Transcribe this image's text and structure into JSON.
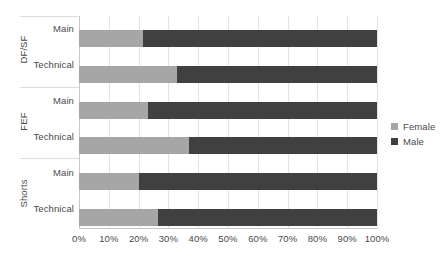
{
  "chart_data": {
    "type": "bar",
    "orientation": "horizontal",
    "stacked": true,
    "normalized": true,
    "title": "",
    "xlabel": "",
    "ylabel": "",
    "xlim": [
      0,
      100
    ],
    "grid": true,
    "legend_position": "right",
    "xticks": [
      "0%",
      "10%",
      "20%",
      "30%",
      "40%",
      "50%",
      "60%",
      "70%",
      "80%",
      "90%",
      "100%"
    ],
    "xtick_values": [
      0,
      10,
      20,
      30,
      40,
      50,
      60,
      70,
      80,
      90,
      100
    ],
    "groups": [
      {
        "label": "DF/SF",
        "categories": [
          {
            "label": "Main",
            "female": 21.5,
            "male": 78.5
          },
          {
            "label": "Technical",
            "female": 32.9,
            "male": 67.1
          }
        ]
      },
      {
        "label": "FEF",
        "categories": [
          {
            "label": "Main",
            "female": 23.2,
            "male": 76.8
          },
          {
            "label": "Technical",
            "female": 36.9,
            "male": 63.1
          }
        ]
      },
      {
        "label": "Shorts",
        "categories": [
          {
            "label": "Main",
            "female": 20.1,
            "male": 79.9
          },
          {
            "label": "Technical",
            "female": 26.5,
            "male": 73.5
          }
        ]
      }
    ],
    "series": [
      {
        "name": "Female",
        "color": "#a6a6a6",
        "values": [
          21.5,
          32.9,
          23.2,
          36.9,
          20.1,
          26.5
        ]
      },
      {
        "name": "Male",
        "color": "#404040",
        "values": [
          78.5,
          67.1,
          76.8,
          63.1,
          79.9,
          73.5
        ]
      }
    ],
    "category_order": [
      "DF/SF - Main",
      "DF/SF - Technical",
      "FEF - Main",
      "FEF - Technical",
      "Shorts - Main",
      "Shorts - Technical"
    ]
  },
  "legend": {
    "items": [
      {
        "label": "Female",
        "color": "#a6a6a6"
      },
      {
        "label": "Male",
        "color": "#404040"
      }
    ]
  },
  "axis": {
    "group_labels": [
      "DF/SF",
      "FEF",
      "Shorts"
    ],
    "category_labels": [
      "Main",
      "Technical",
      "Main",
      "Technical",
      "Main",
      "Technical"
    ],
    "xticks": [
      "0%",
      "10%",
      "20%",
      "30%",
      "40%",
      "50%",
      "60%",
      "70%",
      "80%",
      "90%",
      "100%"
    ]
  },
  "colors": {
    "female": "#a6a6a6",
    "male": "#404040",
    "gridline": "#e2e2e2",
    "axis": "#c8c8c8",
    "text": "#4a4a4a",
    "background": "#ffffff"
  }
}
